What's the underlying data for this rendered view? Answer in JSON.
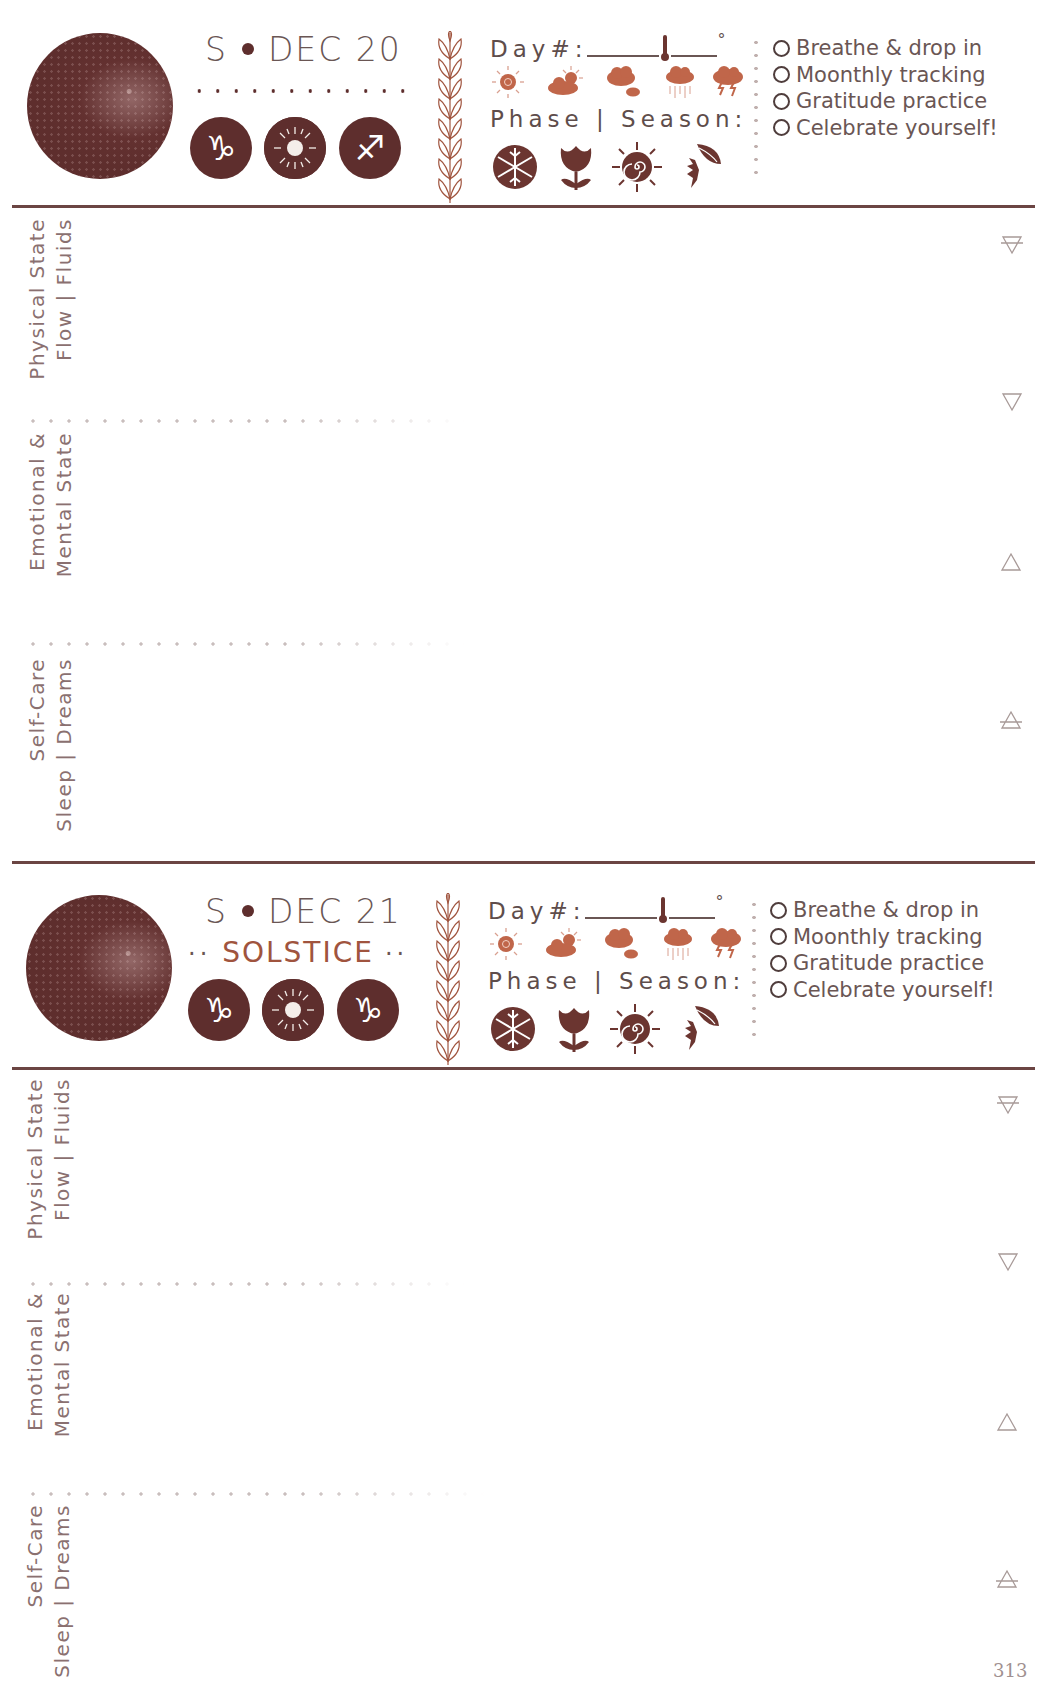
{
  "page_number": "313",
  "colors": {
    "dark_brown": "#5e2e2d",
    "rule_line": "#6b4543",
    "accent_rust": "#c0664a",
    "text_gray_brown": "#6a5654",
    "label_gray": "#8a7070"
  },
  "days": [
    {
      "moon_phase_icon": "waning-gibbous-moon-icon",
      "date": {
        "weekday": "S",
        "separator_icon": "bullet-dot",
        "month_day": "DEC 20"
      },
      "subtitle": null,
      "zodiac_icons": [
        {
          "name": "capricorn-icon",
          "glyph": "♑"
        },
        {
          "name": "sun-icon",
          "glyph": "sun"
        },
        {
          "name": "sagittarius-icon",
          "glyph": "♐"
        }
      ],
      "tracker": {
        "day_label": "Day#:",
        "degree_symbol": "°",
        "weather_icons": [
          "sunny-icon",
          "partly-cloudy-icon",
          "cloudy-icon",
          "rain-icon",
          "storm-icon"
        ],
        "phase_label": "Phase | Season:",
        "season_icons": [
          "winter-snowflake-icon",
          "spring-tulip-icon",
          "summer-sun-spiral-icon",
          "autumn-leaves-icon"
        ]
      },
      "checklist": [
        "Breathe & drop in",
        "Moonthly tracking",
        "Gratitude practice",
        "Celebrate yourself!"
      ],
      "sections": [
        {
          "line1": "Physical State",
          "line2": "Flow | Fluids",
          "element_icon": "earth-element-icon"
        },
        {
          "line1": "Emotional &",
          "line2": "Mental State",
          "element_icon": "water-element-icon"
        },
        {
          "line1": "Self-Care",
          "line2": "Sleep | Dreams",
          "element_icon": "air-element-icon"
        }
      ],
      "extra_element_icon": "fire-element-icon"
    },
    {
      "moon_phase_icon": "waning-gibbous-moon-icon",
      "date": {
        "weekday": "S",
        "separator_icon": "bullet-dot",
        "month_day": "DEC 21"
      },
      "subtitle": {
        "dots_left": "··",
        "text": "SOLSTICE",
        "dots_right": "··"
      },
      "zodiac_icons": [
        {
          "name": "capricorn-icon",
          "glyph": "♑"
        },
        {
          "name": "sun-icon",
          "glyph": "sun"
        },
        {
          "name": "capricorn-icon",
          "glyph": "♑"
        }
      ],
      "tracker": {
        "day_label": "Day#:",
        "degree_symbol": "°",
        "weather_icons": [
          "sunny-icon",
          "partly-cloudy-icon",
          "cloudy-icon",
          "rain-icon",
          "storm-icon"
        ],
        "phase_label": "Phase | Season:",
        "season_icons": [
          "winter-snowflake-icon",
          "spring-tulip-icon",
          "summer-sun-spiral-icon",
          "autumn-leaves-icon"
        ]
      },
      "checklist": [
        "Breathe & drop in",
        "Moonthly tracking",
        "Gratitude practice",
        "Celebrate yourself!"
      ],
      "sections": [
        {
          "line1": "Physical State",
          "line2": "Flow | Fluids",
          "element_icon": "earth-element-icon"
        },
        {
          "line1": "Emotional &",
          "line2": "Mental State",
          "element_icon": "water-element-icon"
        },
        {
          "line1": "Self-Care",
          "line2": "Sleep | Dreams",
          "element_icon": "air-element-icon"
        }
      ],
      "extra_element_icon": "fire-element-icon"
    }
  ]
}
